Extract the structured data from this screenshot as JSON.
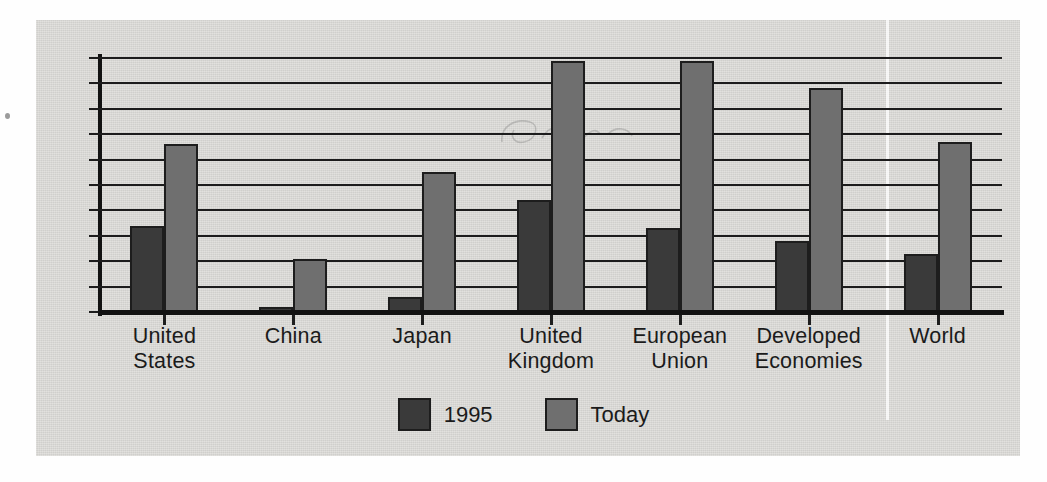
{
  "chart_data": {
    "type": "bar",
    "title": "",
    "xlabel": "",
    "ylabel": "",
    "ylim": [
      0,
      50
    ],
    "ytick_labels": [
      "50",
      "45",
      "40",
      "35",
      "30",
      "25",
      "20",
      "15",
      "10",
      "5",
      "0"
    ],
    "ytick_values": [
      50,
      45,
      40,
      35,
      30,
      25,
      20,
      15,
      10,
      5,
      0
    ],
    "grid": true,
    "legend_position": "bottom-center",
    "categories": [
      "United States",
      "China",
      "Japan",
      "United Kingdom",
      "European Union",
      "Developed Economies",
      "World"
    ],
    "category_lines": [
      [
        "United",
        "States"
      ],
      [
        "China",
        ""
      ],
      [
        "Japan",
        ""
      ],
      [
        "United",
        "Kingdom"
      ],
      [
        "European",
        "Union"
      ],
      [
        "Developed",
        "Economies"
      ],
      [
        "World",
        ""
      ]
    ],
    "series": [
      {
        "name": "1995",
        "color": "#3a3a3a",
        "values": [
          17,
          1,
          3,
          22,
          16.5,
          14,
          11.5
        ]
      },
      {
        "name": "Today",
        "color": "#6f6f6f",
        "values": [
          33,
          10.5,
          27.5,
          49.5,
          49.5,
          44,
          33.5
        ]
      }
    ]
  },
  "legend": {
    "items": [
      {
        "label": "1995",
        "color": "#3a3a3a"
      },
      {
        "label": "Today",
        "color": "#6f6f6f"
      }
    ]
  },
  "colors": {
    "bar_1995": "#3a3a3a",
    "bar_today": "#6f6f6f",
    "paper": "#d9d8d5",
    "axis": "#121212",
    "text": "#1b1b1b"
  }
}
